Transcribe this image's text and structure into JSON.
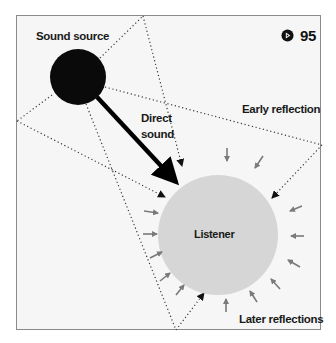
{
  "diagram": {
    "badge": {
      "icon": "play-circle-icon",
      "number": "95"
    },
    "labels": {
      "sound_source": "Sound source",
      "direct_sound_line1": "Direct",
      "direct_sound_line2": "sound",
      "early_reflection": "Early reflection",
      "listener": "Listener",
      "later_reflections": "Later reflections"
    },
    "colors": {
      "frame_bg": "#f6f6f6",
      "frame_border": "#8a8a8a",
      "source_fill": "#0a0a0a",
      "listener_fill": "#d6d6d6",
      "reflection_arrow": "#7a7a7a",
      "direct_arrow": "#000000",
      "dotted_line": "#3a3a3a"
    },
    "nodes": [
      {
        "id": "sound-source",
        "shape": "circle",
        "cx": 78,
        "cy": 77,
        "r": 28
      },
      {
        "id": "listener",
        "shape": "circle",
        "cx": 218,
        "cy": 235,
        "r": 60
      }
    ],
    "edges": [
      {
        "from": "sound-source",
        "to": "listener",
        "type": "direct-sound",
        "style": "solid-thick"
      },
      {
        "from": "sound-source",
        "to": "listener",
        "type": "early-reflection",
        "via": "top-wall",
        "style": "dotted"
      },
      {
        "from": "sound-source",
        "to": "listener",
        "type": "early-reflection",
        "via": "left-wall",
        "style": "dotted"
      },
      {
        "from": "sound-source",
        "to": "listener",
        "type": "early-reflection",
        "via": "right-wall",
        "style": "dotted"
      },
      {
        "from": "sound-source",
        "to": "listener",
        "type": "early-reflection",
        "via": "bottom-wall",
        "style": "dotted"
      },
      {
        "to": "listener",
        "type": "later-reflections",
        "count": 14,
        "style": "short-gray-arrows"
      }
    ]
  }
}
